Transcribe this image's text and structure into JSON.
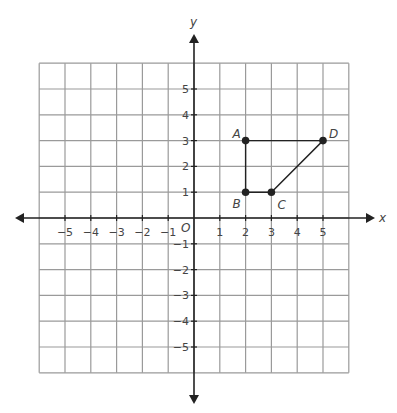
{
  "chart_data": {
    "type": "scatter",
    "title": "",
    "xlabel": "x",
    "ylabel": "y",
    "origin_label": "O",
    "xlim": [
      -6,
      6
    ],
    "ylim": [
      -6,
      6
    ],
    "grid": true,
    "x_ticks": [
      -5,
      -4,
      -3,
      -2,
      -1,
      1,
      2,
      3,
      4,
      5
    ],
    "y_ticks": [
      -5,
      -4,
      -3,
      -2,
      -1,
      1,
      2,
      3,
      4,
      5
    ],
    "x_tick_labels": [
      "−5",
      "−4",
      "−3",
      "−2",
      "−1",
      "1",
      "2",
      "3",
      "4",
      "5"
    ],
    "y_tick_labels": [
      "−5",
      "−4",
      "−3",
      "−2",
      "−1",
      "1",
      "2",
      "3",
      "4",
      "5"
    ],
    "points": [
      {
        "label": "A",
        "x": 2,
        "y": 3
      },
      {
        "label": "B",
        "x": 2,
        "y": 1
      },
      {
        "label": "C",
        "x": 3,
        "y": 1
      },
      {
        "label": "D",
        "x": 5,
        "y": 3
      }
    ],
    "polygon": [
      "A",
      "B",
      "C",
      "D"
    ]
  },
  "colors": {
    "grid": "#9a9a9a",
    "axis": "#222222",
    "shape": "#222222",
    "text": "#444444"
  }
}
